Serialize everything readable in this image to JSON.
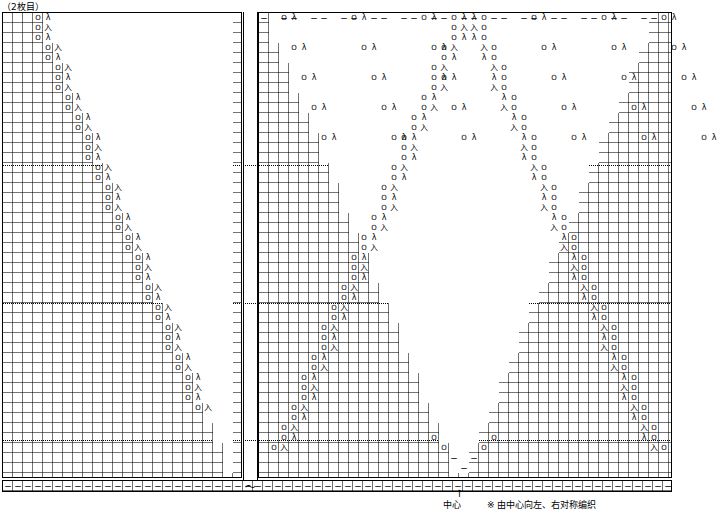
{
  "document": {
    "top_label": "（2枚目）",
    "footnote": "※ 由中心向左、右对称编织",
    "center_label": "中心",
    "tilde": "～"
  },
  "chart": {
    "type": "knitting-stitch-chart",
    "cell_size": 10,
    "symbols": {
      "yarn_over": "O",
      "knit": "",
      "purl": "−",
      "ssk": "λ",
      "k2tog": "λ",
      "right_lean": "入",
      "left_lean": "人",
      "plain": "│"
    },
    "panels": [
      {
        "name": "left-panel",
        "x": 2,
        "y": 12,
        "w": 240,
        "h": 466
      },
      {
        "name": "right-panel",
        "x": 258,
        "y": 12,
        "w": 414,
        "h": 466
      },
      {
        "name": "bottom-strip",
        "x": 2,
        "y": 480,
        "w": 670,
        "h": 12
      }
    ],
    "guides": [
      {
        "name": "guide-line-1",
        "y": 165
      },
      {
        "name": "guide-line-2",
        "y": 303
      },
      {
        "name": "guide-line-3",
        "y": 440
      }
    ],
    "center_x": 458
  }
}
